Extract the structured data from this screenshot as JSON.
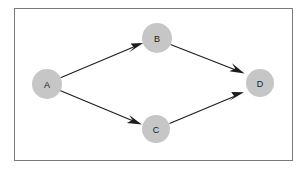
{
  "diagram": {
    "frame": {
      "border_color": "#7a7a7a",
      "background": "#ffffff"
    },
    "node_style": {
      "fill": "#c6c6c6",
      "label_color": "#1a1a1a",
      "radius": 14
    },
    "edge_style": {
      "stroke": "#1c1c1c",
      "width": 1.1
    },
    "nodes": [
      {
        "id": "A",
        "label": "A",
        "cx": 47,
        "cy": 84,
        "r": 15
      },
      {
        "id": "B",
        "label": "B",
        "cx": 157,
        "cy": 38,
        "r": 15
      },
      {
        "id": "C",
        "label": "C",
        "cx": 156,
        "cy": 129,
        "r": 14
      },
      {
        "id": "D",
        "label": "D",
        "cx": 260,
        "cy": 83,
        "r": 14
      }
    ],
    "edges": [
      {
        "id": "A-B",
        "from": "A",
        "to": "B",
        "directed": true
      },
      {
        "id": "A-C",
        "from": "A",
        "to": "C",
        "directed": true
      },
      {
        "id": "B-D",
        "from": "B",
        "to": "D",
        "directed": true
      },
      {
        "id": "C-D",
        "from": "C",
        "to": "D",
        "directed": true
      }
    ]
  }
}
